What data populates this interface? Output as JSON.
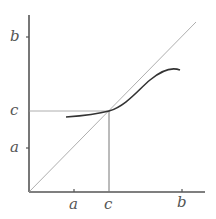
{
  "diagram": {
    "type": "fixed-point iteration plot",
    "axes": {
      "x_tick_labels": [
        "a",
        "c",
        "b"
      ],
      "y_tick_labels": [
        "b",
        "c",
        "a"
      ]
    },
    "elements": {
      "identity_line": "y = x diagonal",
      "curve": "function curve crossing diagonal at fixed point c",
      "guide_lines": "horizontal and vertical guides at c"
    },
    "labels": {
      "y_b": "b",
      "y_c": "c",
      "y_a": "a",
      "x_a": "a",
      "x_c": "c",
      "x_b": "b"
    },
    "colors": {
      "axis": "#555555",
      "thin_line": "#888888",
      "curve": "#333333"
    }
  }
}
